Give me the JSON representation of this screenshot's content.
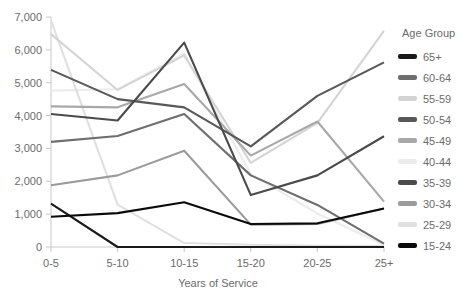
{
  "chart_data": {
    "type": "line",
    "title": "",
    "xlabel": "Years of Service",
    "ylabel": "",
    "categories": [
      "0-5",
      "5-10",
      "10-15",
      "15-20",
      "20-25",
      "25+"
    ],
    "x": [
      0,
      1,
      2,
      3,
      4,
      5
    ],
    "ylim": [
      0,
      7000
    ],
    "ytick_labels": [
      "0",
      "1,000",
      "2,000",
      "3,000",
      "4,000",
      "5,000",
      "6,000",
      "7,000"
    ],
    "ytick_values": [
      0,
      1000,
      2000,
      3000,
      4000,
      5000,
      6000,
      7000
    ],
    "grid": false,
    "legend_title": "Age Group",
    "legend_position": "right",
    "series": [
      {
        "name": "65+",
        "color": "#1a1a1a",
        "values": [
          1320,
          0,
          0,
          0,
          0,
          0
        ]
      },
      {
        "name": "60-64",
        "color": "#6e6e6e",
        "values": [
          3200,
          3380,
          4050,
          2180,
          1280,
          100
        ]
      },
      {
        "name": "55-59",
        "color": "#d4d4d4",
        "values": [
          6480,
          4780,
          5830,
          2560,
          3780,
          6580
        ]
      },
      {
        "name": "50-54",
        "color": "#585858",
        "values": [
          5390,
          4500,
          4250,
          3060,
          4600,
          5620
        ]
      },
      {
        "name": "45-49",
        "color": "#a8a8a8",
        "values": [
          4280,
          4250,
          4960,
          2780,
          3820,
          1380
        ]
      },
      {
        "name": "40-44",
        "color": "#ececec",
        "values": [
          4760,
          4800,
          5880,
          2220,
          1020,
          60
        ]
      },
      {
        "name": "35-39",
        "color": "#4a4a4a",
        "values": [
          4050,
          3850,
          6220,
          1580,
          2180,
          3370
        ]
      },
      {
        "name": "30-34",
        "color": "#9b9b9b",
        "values": [
          1880,
          2180,
          2930,
          680,
          700,
          1170
        ]
      },
      {
        "name": "25-29",
        "color": "#e0e0e0",
        "values": [
          6900,
          1290,
          120,
          70,
          40,
          30
        ]
      },
      {
        "name": "15-24",
        "color": "#0a0a0a",
        "values": [
          920,
          1030,
          1360,
          700,
          720,
          1170
        ]
      }
    ]
  },
  "legend": {
    "title": "Age Group",
    "items": [
      {
        "label": "65+"
      },
      {
        "label": "60-64"
      },
      {
        "label": "55-59"
      },
      {
        "label": "50-54"
      },
      {
        "label": "45-49"
      },
      {
        "label": "40-44"
      },
      {
        "label": "35-39"
      },
      {
        "label": "30-34"
      },
      {
        "label": "25-29"
      },
      {
        "label": "15-24"
      }
    ]
  },
  "axes": {
    "x_title": "Years of Service",
    "x_labels": [
      "0-5",
      "5-10",
      "10-15",
      "15-20",
      "20-25",
      "25+"
    ],
    "y_labels": [
      "7,000",
      "6,000",
      "5,000",
      "4,000",
      "3,000",
      "2,000",
      "1,000",
      "0"
    ]
  }
}
